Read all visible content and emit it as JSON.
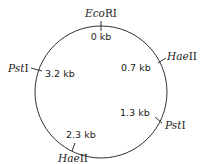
{
  "diagram": {
    "type": "restriction map (circular plasmid)",
    "sites": [
      {
        "enzyme_italic": "Eco",
        "enzyme_roman": "RI",
        "position": "0 kb"
      },
      {
        "enzyme_italic": "Hae",
        "enzyme_roman": "II",
        "position": "0.7 kb"
      },
      {
        "enzyme_italic": "Pst",
        "enzyme_roman": "I",
        "position": "1.3 kb"
      },
      {
        "enzyme_italic": "Hae",
        "enzyme_roman": "II",
        "position": "2.3 kb"
      },
      {
        "enzyme_italic": "Pst",
        "enzyme_roman": "I",
        "position": "3.2 kb"
      }
    ]
  }
}
